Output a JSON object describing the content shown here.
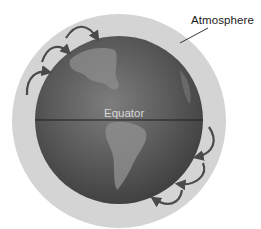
{
  "diagram": {
    "labels": {
      "atmosphere": "Atmosphere",
      "equator": "Equator"
    },
    "colors": {
      "background": "#ffffff",
      "atmosphere": "#d2d2d2",
      "globe_dark": "#4a4a4a",
      "globe_light": "#8a8a8a",
      "equator_line": "#1e1e1e",
      "arrows": "#555555"
    },
    "arrows": {
      "northern_hemisphere_count": 3,
      "southern_hemisphere_count": 3
    }
  }
}
